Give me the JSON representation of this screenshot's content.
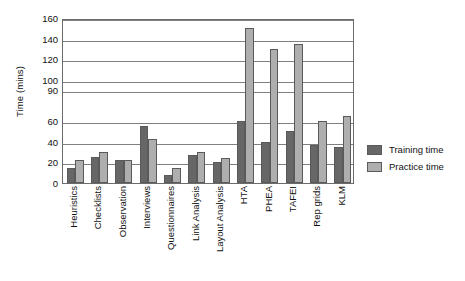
{
  "chart_data": {
    "type": "bar",
    "title": "",
    "xlabel": "",
    "ylabel": "Time (mins)",
    "ylim": [
      0,
      160
    ],
    "yticks": [
      0,
      20,
      40,
      60,
      90,
      100,
      120,
      140,
      160
    ],
    "ytick_labels": [
      "0",
      "20",
      "40",
      "60",
      "90",
      "100",
      "120",
      "140",
      "160"
    ],
    "grid": true,
    "legend_position": "right",
    "categories": [
      "Heuristics",
      "Checklists",
      "Observation",
      "Interviews",
      "Questionnaires",
      "Link Analysis",
      "Layout Analysis",
      "HTA",
      "PHEA",
      "TAFEI",
      "Rep grids",
      "KLM"
    ],
    "series": [
      {
        "name": "Training time",
        "color": "#676767",
        "values": [
          15,
          25,
          22,
          55,
          8,
          27,
          20,
          60,
          40,
          50,
          37,
          35
        ]
      },
      {
        "name": "Practice time",
        "color": "#aeaeae",
        "values": [
          22,
          30,
          22,
          43,
          15,
          30,
          24,
          150,
          130,
          135,
          60,
          65
        ]
      }
    ]
  },
  "legend": {
    "items": [
      {
        "label": "Training time"
      },
      {
        "label": "Practice time"
      }
    ]
  }
}
